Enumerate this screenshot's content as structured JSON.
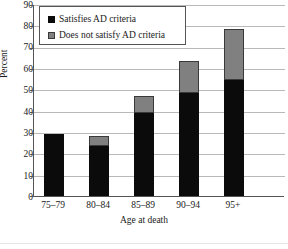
{
  "chart_data": {
    "type": "bar",
    "title": "",
    "xlabel": "Age at death",
    "ylabel": "Percent",
    "ylim": [
      0,
      90
    ],
    "ytick_step": 10,
    "yticks": [
      0,
      10,
      20,
      30,
      40,
      50,
      60,
      70,
      80,
      90
    ],
    "grid": true,
    "stacked": true,
    "legend_position": "top-left-inside",
    "categories": [
      "75–79",
      "80–84",
      "85–89",
      "90–94",
      "95+"
    ],
    "series": [
      {
        "name": "Satisfies AD criteria",
        "color": "#0b0b0b",
        "values": [
          29,
          23.5,
          39,
          48.5,
          54.5
        ]
      },
      {
        "name": "Does not satisfy AD criteria",
        "color": "#808080",
        "values": [
          0,
          4.5,
          8,
          15,
          24
        ]
      }
    ],
    "totals": [
      29,
      28,
      47,
      63.5,
      78.5
    ]
  },
  "axes": {
    "y_title": "Percent",
    "y_tick_labels": [
      "90",
      "80",
      "70",
      "60",
      "50",
      "40",
      "30",
      "20",
      "10",
      "0"
    ],
    "x_title": "Age at death",
    "x_tick_labels": [
      "75–79",
      "80–84",
      "85–89",
      "90–94",
      "95+"
    ]
  },
  "legend": {
    "items": [
      {
        "label": "Satisfies AD criteria",
        "color": "#0b0b0b"
      },
      {
        "label": "Does not satisfy AD criteria",
        "color": "#808080"
      }
    ]
  }
}
